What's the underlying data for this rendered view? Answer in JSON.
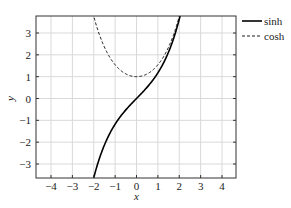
{
  "chart_data": {
    "type": "line",
    "title": "",
    "xlabel": "x",
    "ylabel": "y",
    "xlim": [
      -4.7,
      4.7
    ],
    "ylim": [
      -3.7,
      3.8
    ],
    "xticks": [
      -4,
      -3,
      -2,
      -1,
      0,
      1,
      2,
      3,
      4
    ],
    "yticks": [
      -3,
      -2,
      -1,
      0,
      1,
      2,
      3
    ],
    "xtick_labels": [
      "−4",
      "−3",
      "−2",
      "−1",
      "0",
      "1",
      "2",
      "3",
      "4"
    ],
    "ytick_labels": [
      "−3",
      "−2",
      "−1",
      "0",
      "1",
      "2",
      "3"
    ],
    "grid": true,
    "legend_position": "outside upper right",
    "series": [
      {
        "name": "sinh",
        "style": "solid",
        "color": "#000000",
        "x": [
          -2.0,
          -1.75,
          -1.5,
          -1.25,
          -1.0,
          -0.75,
          -0.5,
          -0.25,
          0,
          0.25,
          0.5,
          0.75,
          1.0,
          1.25,
          1.5,
          1.75,
          2.0
        ],
        "y": [
          -3.63,
          -2.79,
          -2.13,
          -1.6,
          -1.18,
          -0.82,
          -0.52,
          -0.25,
          0,
          0.25,
          0.52,
          0.82,
          1.18,
          1.6,
          2.13,
          2.79,
          3.63
        ]
      },
      {
        "name": "cosh",
        "style": "dashed",
        "color": "#000000",
        "x": [
          -2.0,
          -1.75,
          -1.5,
          -1.25,
          -1.0,
          -0.75,
          -0.5,
          -0.25,
          0,
          0.25,
          0.5,
          0.75,
          1.0,
          1.25,
          1.5,
          1.75,
          2.0
        ],
        "y": [
          3.76,
          2.96,
          2.35,
          1.89,
          1.54,
          1.29,
          1.13,
          1.03,
          1.0,
          1.03,
          1.13,
          1.29,
          1.54,
          1.89,
          2.35,
          2.96,
          3.76
        ]
      }
    ]
  },
  "legend": {
    "items": [
      {
        "label": "sinh",
        "style": "solid"
      },
      {
        "label": "cosh",
        "style": "dashed"
      }
    ]
  },
  "colors": {
    "grid": "#d9d9d9",
    "axis": "#333333",
    "line": "#000000"
  }
}
